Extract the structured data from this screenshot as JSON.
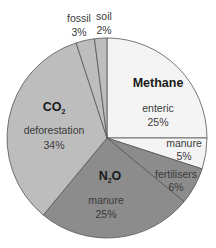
{
  "chart_data": {
    "type": "pie",
    "title": "",
    "groups": [
      {
        "name": "Methane",
        "display": "Methane"
      },
      {
        "name": "N2O",
        "display": "N₂O"
      },
      {
        "name": "CO2",
        "display": "CO₂"
      }
    ],
    "slices": [
      {
        "group": "Methane",
        "label": "enteric",
        "value": 25,
        "value_label": "25%",
        "color": "#f4f4f4"
      },
      {
        "group": "Methane",
        "label": "manure",
        "value": 5,
        "value_label": "5%",
        "color": "#f4f4f4"
      },
      {
        "group": "N2O",
        "label": "fertilisers",
        "value": 6,
        "value_label": "6%",
        "color": "#8c8c8c"
      },
      {
        "group": "N2O",
        "label": "manure",
        "value": 25,
        "value_label": "25%",
        "color": "#8c8c8c"
      },
      {
        "group": "CO2",
        "label": "deforestation",
        "value": 34,
        "value_label": "34%",
        "color": "#bdbdbd"
      },
      {
        "group": "CO2",
        "label": "fossil",
        "value": 3,
        "value_label": "3%",
        "color": "#bdbdbd"
      },
      {
        "group": "CO2",
        "label": "soil",
        "value": 2,
        "value_label": "2%",
        "color": "#bdbdbd"
      }
    ],
    "start_angle": "12 o'clock, clockwise",
    "legend": "none (labels inline)"
  },
  "labels": {
    "methane": "Methane",
    "n2o_main": "N",
    "n2o_sub": "2",
    "n2o_tail": "O",
    "co2_main": "CO",
    "co2_sub": "2",
    "enteric": "enteric",
    "enteric_pct": "25%",
    "methane_manure": "manure",
    "methane_manure_pct": "5%",
    "fertilisers": "fertilisers",
    "fertilisers_pct": "6%",
    "n2o_manure": "manure",
    "n2o_manure_pct": "25%",
    "deforestation": "deforestation",
    "deforestation_pct": "34%",
    "fossil": "fossil",
    "fossil_pct": "3%",
    "soil": "soil",
    "soil_pct": "2%"
  }
}
